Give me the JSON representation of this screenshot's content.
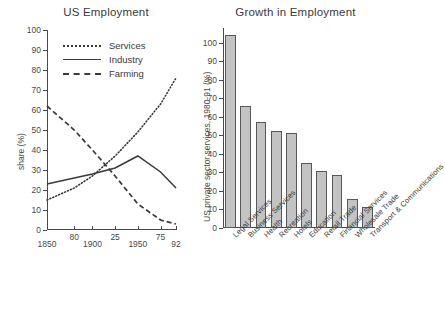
{
  "figure": {
    "background": "#ffffff",
    "ink": "#3a3a3a"
  },
  "chart_data": [
    {
      "type": "line",
      "id": "us-employment",
      "title": "US Employment",
      "xlabel": "",
      "ylabel": "share (%)",
      "ylim": [
        0,
        100
      ],
      "yticks": [
        0,
        10,
        20,
        30,
        40,
        50,
        60,
        70,
        80,
        90,
        100
      ],
      "xlim": [
        1850,
        1992
      ],
      "xticks": [
        1850,
        1880,
        1900,
        1925,
        1950,
        1975,
        1992
      ],
      "xticklabels": [
        "1850",
        "80",
        "1900",
        "25",
        "1950",
        "75",
        "92"
      ],
      "grid": false,
      "legend_position": "upper-left-inside",
      "series": [
        {
          "name": "Services",
          "style": "dotted",
          "color": "#3a3a3a",
          "x": [
            1850,
            1880,
            1900,
            1925,
            1950,
            1975,
            1992
          ],
          "values": [
            15,
            21,
            27,
            37,
            49,
            63,
            76
          ]
        },
        {
          "name": "Industry",
          "style": "solid",
          "color": "#3a3a3a",
          "x": [
            1850,
            1880,
            1900,
            1925,
            1950,
            1975,
            1992
          ],
          "values": [
            23,
            26,
            28,
            31,
            37,
            29,
            21
          ]
        },
        {
          "name": "Farming",
          "style": "dashed",
          "color": "#3a3a3a",
          "x": [
            1850,
            1880,
            1900,
            1925,
            1950,
            1975,
            1992
          ],
          "values": [
            62,
            50,
            40,
            27,
            13,
            5,
            3
          ]
        }
      ]
    },
    {
      "type": "bar",
      "id": "growth-in-employment",
      "title": "Growth in Employment",
      "xlabel": "",
      "ylabel": "US private sector services, 1980-91 (%)",
      "ylim": [
        0,
        108
      ],
      "yticks": [
        0,
        10,
        20,
        30,
        40,
        50,
        60,
        70,
        80,
        90,
        100
      ],
      "grid": false,
      "bar_color": "#c3c3c3",
      "bar_edge_color": "#585858",
      "categories": [
        "Legal Services",
        "Business Services",
        "Health",
        "Recreation",
        "Hotels",
        "Education",
        "Retail Trade",
        "Financial Services",
        "Wholesale Trade",
        "Transport & Communications"
      ],
      "values": [
        104,
        66,
        57.5,
        52.5,
        51.5,
        35,
        31,
        28.5,
        15.5,
        11.5
      ]
    }
  ]
}
